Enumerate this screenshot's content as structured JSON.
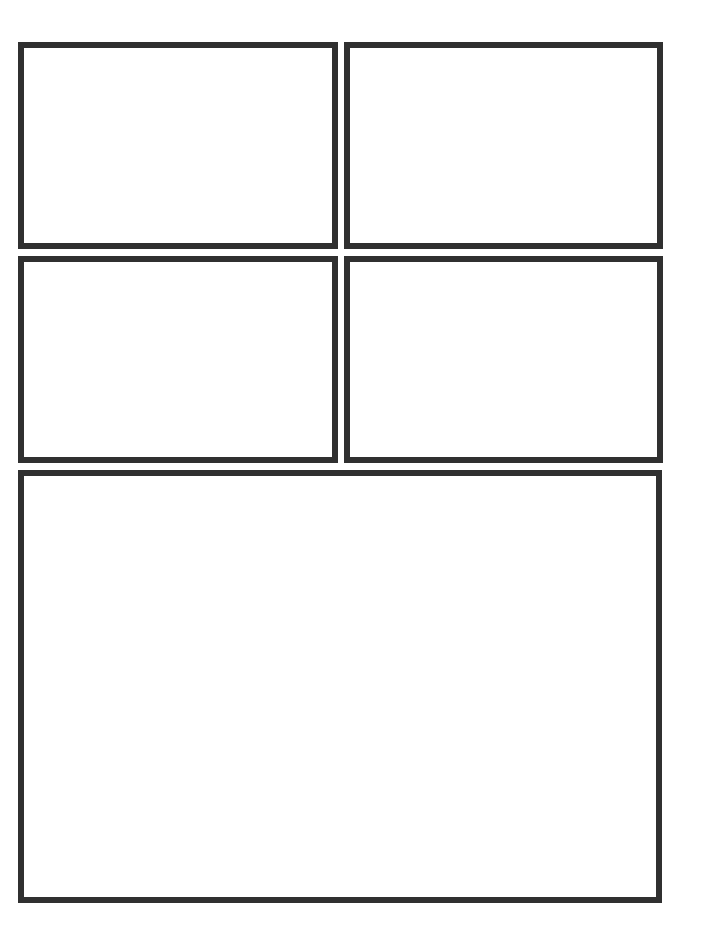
{
  "page": {
    "background_color": "#ffffff",
    "border_color": "#303030",
    "border_width_px": 6
  },
  "panels": [
    {
      "id": "panel-1",
      "position": "top-left",
      "x": 18,
      "y": 42,
      "width": 320,
      "height": 207,
      "content": ""
    },
    {
      "id": "panel-2",
      "position": "top-right",
      "x": 344,
      "y": 42,
      "width": 319,
      "height": 207,
      "content": ""
    },
    {
      "id": "panel-3",
      "position": "middle-left",
      "x": 18,
      "y": 256,
      "width": 320,
      "height": 207,
      "content": ""
    },
    {
      "id": "panel-4",
      "position": "middle-right",
      "x": 344,
      "y": 256,
      "width": 319,
      "height": 207,
      "content": ""
    },
    {
      "id": "panel-5",
      "position": "bottom-wide",
      "x": 18,
      "y": 470,
      "width": 644,
      "height": 433,
      "content": ""
    }
  ]
}
